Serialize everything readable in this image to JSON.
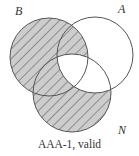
{
  "diagram": {
    "type": "venn-3-syllogism",
    "caption": "AAA-1, valid",
    "sets": [
      {
        "id": "B",
        "label": "B",
        "cx": 49,
        "cy": 57,
        "r": 39
      },
      {
        "id": "A",
        "label": "A",
        "cx": 95,
        "cy": 55,
        "r": 38
      },
      {
        "id": "N",
        "label": "N",
        "cx": 72,
        "cy": 93,
        "r": 39
      }
    ],
    "shaded_regions": [
      "B only",
      "B∩A not N",
      "B∩N not A",
      "N only"
    ],
    "unshaded_regions": [
      "A only",
      "A∩N not B",
      "B∩A∩N"
    ],
    "colors": {
      "shade_fill": "#cdcdcd",
      "hatch_line": "#6a6a6a",
      "outline": "#555555",
      "text": "#333333"
    }
  }
}
